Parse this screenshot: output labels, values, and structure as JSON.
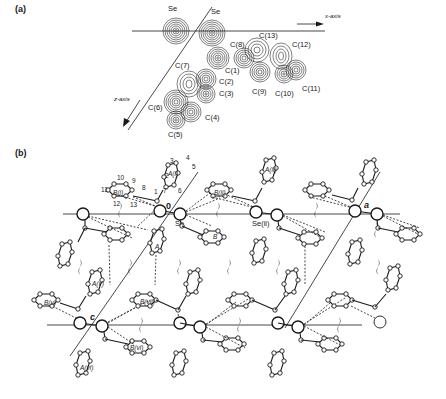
{
  "figure": {
    "panel_a": {
      "label": "(a)",
      "title": "Electron density projection",
      "axis_x_label": "x-axis",
      "axis_z_label": "z-axis",
      "atoms": [
        {
          "name": "Se",
          "label": "Se",
          "x": 176,
          "y": 30,
          "tx": 168,
          "ty": 11
        },
        {
          "name": "Se",
          "label": "Se",
          "x": 212,
          "y": 33,
          "tx": 211,
          "ty": 13
        },
        {
          "name": "C1",
          "label": "C(1)",
          "x": 218,
          "y": 58,
          "tx": 224,
          "ty": 72
        },
        {
          "name": "C2",
          "label": "C(2)",
          "x": 206,
          "y": 80,
          "tx": 217,
          "ty": 86
        },
        {
          "name": "C3",
          "label": "C(3)",
          "x": 206,
          "y": 95,
          "tx": 217,
          "ty": 97
        },
        {
          "name": "C4",
          "label": "C(4)",
          "x": 191,
          "y": 113,
          "tx": 204,
          "ty": 119
        },
        {
          "name": "C5",
          "label": "C(5)",
          "x": 176,
          "y": 120,
          "tx": 170,
          "ty": 136
        },
        {
          "name": "C6",
          "label": "C(6)",
          "x": 178,
          "y": 102,
          "tx": 149,
          "ty": 108
        },
        {
          "name": "C7",
          "label": "C(7)",
          "x": 190,
          "y": 83,
          "tx": 175,
          "ty": 67
        },
        {
          "name": "C8",
          "label": "C(8)",
          "x": 244,
          "y": 56,
          "tx": 230,
          "ty": 46
        },
        {
          "name": "C9",
          "label": "C(9)",
          "x": 259,
          "y": 73,
          "tx": 252,
          "ty": 92
        },
        {
          "name": "C10",
          "label": "C(10)",
          "x": 284,
          "y": 73,
          "tx": 276,
          "ty": 95
        },
        {
          "name": "C11",
          "label": "C(11)",
          "x": 296,
          "y": 70,
          "tx": 302,
          "ty": 90
        },
        {
          "name": "C12",
          "label": "C(12)",
          "x": 280,
          "y": 57,
          "tx": 292,
          "ty": 46
        },
        {
          "name": "C13",
          "label": "C(13)",
          "x": 256,
          "y": 50,
          "tx": 259,
          "ty": 38
        }
      ]
    },
    "panel_b": {
      "label": "(b)",
      "title": "Crystal packing diagram",
      "origin_label": "0",
      "axis_a_label": "a",
      "axis_c_label": "c",
      "se_label": "Se",
      "se_ii_label": "Se(ii)",
      "ring_labels": {
        "A_i": "A(i)",
        "B_i": "B(i)",
        "A_ii": "A(ii)",
        "B_ii": "B(ii)",
        "A": "A",
        "B": "B",
        "A_v": "A(v)",
        "B_v": "B(v)",
        "A_vi": "A(vi)",
        "B_vi": "B(vi)",
        "B_vii": "B(vii)"
      },
      "atom_numbers_top": [
        "1",
        "2",
        "3",
        "4",
        "5",
        "6",
        "7",
        "8",
        "9",
        "10",
        "11",
        "12",
        "13"
      ],
      "symmetry_element": "2-fold screw axis"
    }
  }
}
